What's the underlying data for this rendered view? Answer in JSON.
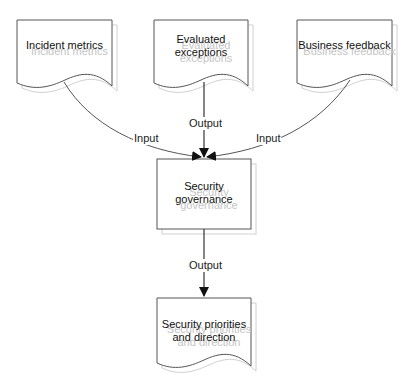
{
  "diagram": {
    "type": "flowchart",
    "colors": {
      "stroke": "#555555",
      "shadow": "#d0d0d0",
      "text": "#111111",
      "ghost_text": "#c4c4c4",
      "background": "#ffffff"
    },
    "nodes": [
      {
        "id": "incident",
        "shape": "document",
        "lines": [
          "Incident metrics"
        ]
      },
      {
        "id": "exceptions",
        "shape": "document",
        "lines": [
          "Evaluated",
          "exceptions"
        ]
      },
      {
        "id": "business",
        "shape": "document",
        "lines": [
          "Business feedback"
        ]
      },
      {
        "id": "governance",
        "shape": "process",
        "lines": [
          "Security",
          "governance"
        ]
      },
      {
        "id": "priorities",
        "shape": "document",
        "lines": [
          "Security priorities",
          "and direction"
        ]
      }
    ],
    "edges": [
      {
        "from": "incident",
        "to": "governance",
        "label": "Input"
      },
      {
        "from": "exceptions",
        "to": "governance",
        "label": "Output"
      },
      {
        "from": "business",
        "to": "governance",
        "label": "Input"
      },
      {
        "from": "governance",
        "to": "priorities",
        "label": "Output"
      }
    ]
  }
}
